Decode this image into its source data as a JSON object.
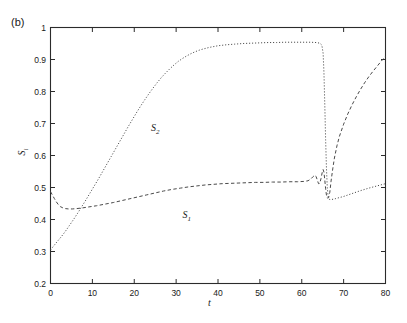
{
  "figure": {
    "panel_label": "(b)",
    "background_color": "#ffffff",
    "axis_color": "#2b2b2b"
  },
  "chart_data": {
    "type": "line",
    "title": "",
    "xlabel": "t",
    "ylabel": "S",
    "ylabel_sub": "i",
    "xlim": [
      0,
      80
    ],
    "ylim": [
      0.2,
      1
    ],
    "grid": false,
    "legend_position": "inline-annotations",
    "xticks": [
      0,
      10,
      20,
      30,
      40,
      50,
      60,
      70,
      80
    ],
    "xtick_labels": [
      "0",
      "10",
      "20",
      "30",
      "40",
      "50",
      "60",
      "70",
      "80"
    ],
    "yticks": [
      0.2,
      0.3,
      0.4,
      0.5,
      0.6,
      0.7,
      0.8,
      0.9,
      1.0
    ],
    "ytick_labels": [
      "0.2",
      "0.3",
      "0.4",
      "0.5",
      "0.6",
      "0.7",
      "0.8",
      "0.9",
      "1"
    ],
    "annotations": [
      {
        "text": "S",
        "sub": "2",
        "x": 24,
        "y": 0.705
      },
      {
        "text": "S",
        "sub": "1",
        "x": 31.5,
        "y": 0.432
      }
    ],
    "series": [
      {
        "name": "S2",
        "label": "S2",
        "style": "dotted",
        "color": "#4a4a4a",
        "points": [
          [
            0.0,
            0.305
          ],
          [
            0.8,
            0.318
          ],
          [
            1.6,
            0.331
          ],
          [
            2.5,
            0.345
          ],
          [
            3.5,
            0.362
          ],
          [
            4.5,
            0.381
          ],
          [
            5.5,
            0.4
          ],
          [
            6.5,
            0.42
          ],
          [
            7.5,
            0.441
          ],
          [
            8.5,
            0.462
          ],
          [
            9.5,
            0.484
          ],
          [
            10.5,
            0.506
          ],
          [
            11.5,
            0.528
          ],
          [
            12.5,
            0.551
          ],
          [
            13.5,
            0.574
          ],
          [
            14.5,
            0.597
          ],
          [
            15.5,
            0.62
          ],
          [
            16.5,
            0.643
          ],
          [
            17.5,
            0.666
          ],
          [
            18.5,
            0.689
          ],
          [
            19.5,
            0.711
          ],
          [
            20.5,
            0.733
          ],
          [
            21.5,
            0.754
          ],
          [
            22.5,
            0.774
          ],
          [
            23.5,
            0.793
          ],
          [
            24.5,
            0.811
          ],
          [
            25.5,
            0.828
          ],
          [
            26.5,
            0.844
          ],
          [
            27.5,
            0.858
          ],
          [
            28.5,
            0.871
          ],
          [
            29.5,
            0.883
          ],
          [
            30.5,
            0.894
          ],
          [
            31.5,
            0.903
          ],
          [
            32.5,
            0.911
          ],
          [
            33.5,
            0.918
          ],
          [
            34.5,
            0.924
          ],
          [
            35.5,
            0.929
          ],
          [
            36.5,
            0.933
          ],
          [
            38.0,
            0.938
          ],
          [
            40.0,
            0.943
          ],
          [
            42.0,
            0.946
          ],
          [
            44.0,
            0.948
          ],
          [
            46.0,
            0.95
          ],
          [
            48.0,
            0.951
          ],
          [
            50.0,
            0.952
          ],
          [
            52.0,
            0.953
          ],
          [
            54.0,
            0.953
          ],
          [
            56.0,
            0.954
          ],
          [
            58.0,
            0.954
          ],
          [
            60.0,
            0.954
          ],
          [
            62.0,
            0.954
          ],
          [
            63.5,
            0.953
          ],
          [
            64.3,
            0.951
          ],
          [
            64.8,
            0.945
          ],
          [
            65.1,
            0.92
          ],
          [
            65.3,
            0.86
          ],
          [
            65.5,
            0.76
          ],
          [
            65.7,
            0.65
          ],
          [
            65.9,
            0.56
          ],
          [
            66.1,
            0.5
          ],
          [
            66.3,
            0.472
          ],
          [
            66.6,
            0.463
          ],
          [
            67.0,
            0.462
          ],
          [
            68.0,
            0.465
          ],
          [
            70.0,
            0.472
          ],
          [
            72.0,
            0.481
          ],
          [
            74.0,
            0.49
          ],
          [
            76.0,
            0.498
          ],
          [
            78.0,
            0.505
          ],
          [
            80.0,
            0.512
          ]
        ]
      },
      {
        "name": "S1",
        "label": "S1",
        "style": "dashed",
        "color": "#4a4a4a",
        "points": [
          [
            0.0,
            0.487
          ],
          [
            0.4,
            0.478
          ],
          [
            0.9,
            0.466
          ],
          [
            1.4,
            0.455
          ],
          [
            1.9,
            0.446
          ],
          [
            2.4,
            0.44
          ],
          [
            3.0,
            0.436
          ],
          [
            3.6,
            0.434
          ],
          [
            4.3,
            0.433
          ],
          [
            5.2,
            0.433
          ],
          [
            6.2,
            0.434
          ],
          [
            7.5,
            0.436
          ],
          [
            9.0,
            0.439
          ],
          [
            11.0,
            0.443
          ],
          [
            13.0,
            0.448
          ],
          [
            15.0,
            0.453
          ],
          [
            17.0,
            0.459
          ],
          [
            19.0,
            0.465
          ],
          [
            21.0,
            0.471
          ],
          [
            23.0,
            0.477
          ],
          [
            25.0,
            0.483
          ],
          [
            27.0,
            0.489
          ],
          [
            29.0,
            0.494
          ],
          [
            31.0,
            0.498
          ],
          [
            33.0,
            0.502
          ],
          [
            35.0,
            0.505
          ],
          [
            37.0,
            0.508
          ],
          [
            39.0,
            0.51
          ],
          [
            41.0,
            0.512
          ],
          [
            43.0,
            0.513
          ],
          [
            45.0,
            0.514
          ],
          [
            47.0,
            0.515
          ],
          [
            49.0,
            0.516
          ],
          [
            51.0,
            0.516
          ],
          [
            53.0,
            0.517
          ],
          [
            55.0,
            0.517
          ],
          [
            57.0,
            0.518
          ],
          [
            59.0,
            0.518
          ],
          [
            60.5,
            0.519
          ],
          [
            61.5,
            0.521
          ],
          [
            62.2,
            0.527
          ],
          [
            62.7,
            0.534
          ],
          [
            63.1,
            0.538
          ],
          [
            63.4,
            0.535
          ],
          [
            63.7,
            0.524
          ],
          [
            64.0,
            0.512
          ],
          [
            64.3,
            0.513
          ],
          [
            64.6,
            0.528
          ],
          [
            64.9,
            0.548
          ],
          [
            65.1,
            0.556
          ],
          [
            65.3,
            0.548
          ],
          [
            65.5,
            0.524
          ],
          [
            65.7,
            0.496
          ],
          [
            65.9,
            0.476
          ],
          [
            66.1,
            0.467
          ],
          [
            66.4,
            0.468
          ],
          [
            66.7,
            0.485
          ],
          [
            67.0,
            0.52
          ],
          [
            67.4,
            0.558
          ],
          [
            67.8,
            0.592
          ],
          [
            68.4,
            0.63
          ],
          [
            69.0,
            0.66
          ],
          [
            70.0,
            0.698
          ],
          [
            71.0,
            0.73
          ],
          [
            72.0,
            0.758
          ],
          [
            73.0,
            0.783
          ],
          [
            74.0,
            0.806
          ],
          [
            75.0,
            0.827
          ],
          [
            76.0,
            0.846
          ],
          [
            77.0,
            0.863
          ],
          [
            78.0,
            0.879
          ],
          [
            79.0,
            0.895
          ],
          [
            80.0,
            0.91
          ]
        ]
      }
    ]
  }
}
